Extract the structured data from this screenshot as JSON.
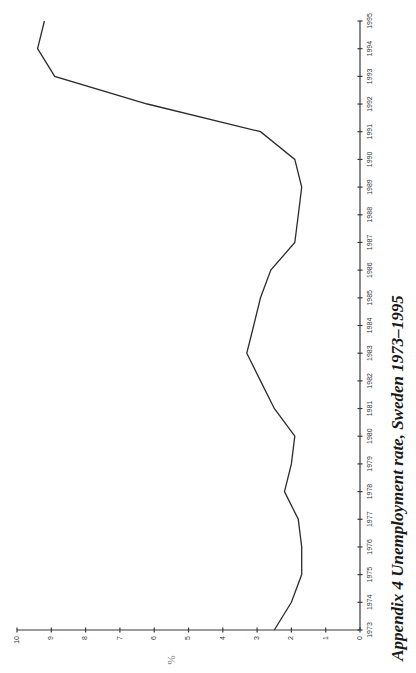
{
  "caption": "Appendix 4 Unemployment rate, Sweden 1973–1995",
  "unit_label": "%",
  "colors": {
    "line": "#2b2b2b",
    "axis": "#3a3a3a",
    "background": "#ffffff"
  },
  "chart_data": {
    "type": "line",
    "title": "Appendix 4 Unemployment rate, Sweden 1973–1995",
    "orientation": "rotated 90° counter-clockwise (years run bottom-to-top, values run right-to-left)",
    "xlabel": "",
    "ylabel": "%",
    "x": [
      1973,
      1974,
      1975,
      1976,
      1977,
      1978,
      1979,
      1980,
      1981,
      1982,
      1983,
      1984,
      1985,
      1986,
      1987,
      1988,
      1989,
      1990,
      1991,
      1992,
      1993,
      1994,
      1995
    ],
    "series": [
      {
        "name": "Unemployment rate",
        "values": [
          2.5,
          2.0,
          1.7,
          1.7,
          1.8,
          2.2,
          2.0,
          1.9,
          2.5,
          2.9,
          3.3,
          3.1,
          2.9,
          2.6,
          1.9,
          1.8,
          1.7,
          1.9,
          2.9,
          6.2,
          8.9,
          9.4,
          9.2
        ]
      }
    ],
    "x_tick_labels": [
      "1973",
      "1974",
      "1975",
      "1976",
      "1977",
      "1978",
      "1979",
      "1980",
      "1981",
      "1982",
      "1983",
      "1984",
      "1985",
      "1986",
      "1987",
      "1988",
      "1989",
      "1990",
      "1991",
      "1992",
      "1993",
      "1994",
      "1995"
    ],
    "y_ticks": [
      0,
      1,
      2,
      3,
      4,
      5,
      6,
      7,
      8,
      9,
      10
    ],
    "y_tick_labels": [
      "0",
      "1",
      "2",
      "3",
      "4",
      "5",
      "6",
      "7",
      "8",
      "9",
      "10"
    ],
    "xlim": [
      1973,
      1995
    ],
    "ylim": [
      0,
      10
    ],
    "grid": false,
    "legend": null
  }
}
